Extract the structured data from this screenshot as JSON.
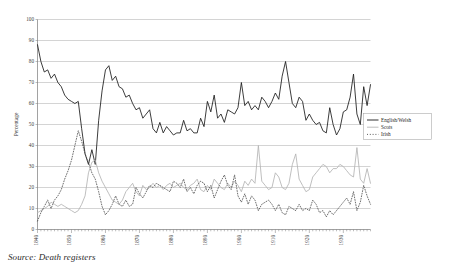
{
  "source_note": "Source: Death registers",
  "legend": {
    "position": "right-middle",
    "items": [
      {
        "label": "English/Welsh",
        "style": "solid",
        "color": "#1a1a1a"
      },
      {
        "label": "Scots",
        "style": "solid",
        "color": "#b4b4b4"
      },
      {
        "label": "Irish",
        "style": "dotted",
        "color": "#4a4a4a"
      }
    ]
  },
  "chart_data": {
    "type": "line",
    "title": "",
    "xlabel": "",
    "ylabel": "Percentage",
    "xlim": [
      1840,
      1938
    ],
    "ylim": [
      0,
      100
    ],
    "grid": true,
    "yticks": [
      0,
      10,
      20,
      30,
      40,
      50,
      60,
      70,
      80,
      90,
      100
    ],
    "xticks": [
      1840,
      1850,
      1860,
      1870,
      1880,
      1890,
      1900,
      1910,
      1920,
      1930
    ],
    "xtick_rotation": 90,
    "x": [
      1840,
      1841,
      1842,
      1843,
      1844,
      1845,
      1846,
      1847,
      1848,
      1849,
      1850,
      1851,
      1852,
      1853,
      1854,
      1855,
      1856,
      1857,
      1858,
      1859,
      1860,
      1861,
      1862,
      1863,
      1864,
      1865,
      1866,
      1867,
      1868,
      1869,
      1870,
      1871,
      1872,
      1873,
      1874,
      1875,
      1876,
      1877,
      1878,
      1879,
      1880,
      1881,
      1882,
      1883,
      1884,
      1885,
      1886,
      1887,
      1888,
      1889,
      1890,
      1891,
      1892,
      1893,
      1894,
      1895,
      1896,
      1897,
      1898,
      1899,
      1900,
      1901,
      1902,
      1903,
      1904,
      1905,
      1906,
      1907,
      1908,
      1909,
      1910,
      1911,
      1912,
      1913,
      1914,
      1915,
      1916,
      1917,
      1918,
      1919,
      1920,
      1921,
      1922,
      1923,
      1924,
      1925,
      1926,
      1927,
      1928,
      1929,
      1930,
      1931,
      1932,
      1933,
      1934,
      1935,
      1936,
      1937,
      1938
    ],
    "series": [
      {
        "name": "English/Welsh",
        "style": "solid",
        "color": "#1a1a1a",
        "values": [
          88,
          80,
          75,
          76,
          72,
          74,
          70,
          68,
          64,
          62,
          61,
          60,
          61,
          48,
          36,
          31,
          38,
          31,
          52,
          66,
          76,
          78,
          71,
          73,
          68,
          67,
          63,
          64,
          60,
          57,
          58,
          53,
          55,
          57,
          48,
          46,
          51,
          46,
          49,
          47,
          45,
          46,
          46,
          52,
          47,
          48,
          46,
          46,
          53,
          49,
          61,
          56,
          64,
          53,
          55,
          51,
          57,
          56,
          55,
          58,
          70,
          59,
          61,
          57,
          59,
          57,
          63,
          61,
          58,
          61,
          65,
          62,
          73,
          80,
          70,
          60,
          58,
          63,
          61,
          52,
          55,
          52,
          50,
          51,
          47,
          46,
          58,
          50,
          45,
          48,
          56,
          57,
          63,
          74,
          55,
          50,
          68,
          59,
          69
        ]
      },
      {
        "name": "Scots",
        "style": "solid",
        "color": "#b4b4b4",
        "values": [
          8,
          9,
          10,
          11,
          13,
          12,
          11,
          12,
          11,
          10,
          9,
          8,
          9,
          12,
          16,
          27,
          32,
          33,
          27,
          23,
          20,
          17,
          14,
          13,
          12,
          14,
          18,
          20,
          22,
          18,
          16,
          21,
          19,
          20,
          22,
          20,
          21,
          19,
          21,
          22,
          20,
          21,
          22,
          20,
          19,
          21,
          22,
          24,
          19,
          18,
          21,
          19,
          24,
          22,
          20,
          19,
          22,
          20,
          23,
          21,
          18,
          23,
          21,
          24,
          22,
          40,
          23,
          21,
          19,
          20,
          27,
          25,
          20,
          19,
          22,
          31,
          36,
          24,
          21,
          18,
          19,
          25,
          27,
          29,
          31,
          30,
          27,
          29,
          29,
          31,
          30,
          28,
          26,
          25,
          39,
          24,
          22,
          29,
          22
        ]
      },
      {
        "name": "Irish",
        "style": "dotted",
        "color": "#4a4a4a",
        "values": [
          4,
          8,
          11,
          14,
          10,
          14,
          16,
          19,
          24,
          28,
          33,
          40,
          47,
          42,
          36,
          32,
          27,
          24,
          18,
          11,
          7,
          9,
          12,
          16,
          12,
          11,
          14,
          11,
          12,
          20,
          17,
          15,
          18,
          21,
          20,
          22,
          21,
          20,
          19,
          18,
          23,
          22,
          20,
          24,
          18,
          20,
          17,
          21,
          23,
          22,
          18,
          21,
          15,
          19,
          23,
          26,
          21,
          19,
          26,
          16,
          13,
          17,
          12,
          16,
          14,
          9,
          12,
          13,
          14,
          12,
          9,
          12,
          8,
          7,
          11,
          10,
          9,
          12,
          9,
          10,
          9,
          14,
          12,
          8,
          9,
          6,
          9,
          7,
          9,
          11,
          13,
          15,
          12,
          18,
          9,
          13,
          21,
          16,
          12
        ]
      }
    ]
  }
}
